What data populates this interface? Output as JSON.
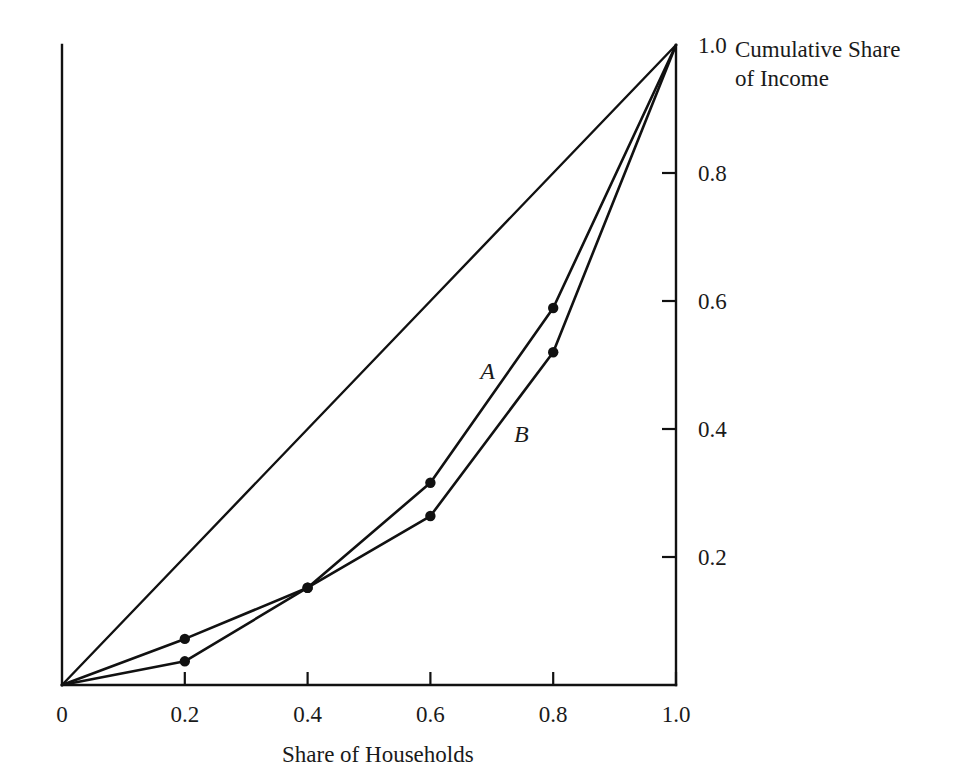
{
  "chart_data": {
    "type": "line",
    "title": "",
    "subtitle": "",
    "xlabel": "Share of Households",
    "ylabel": "Cumulative Share\nof Income",
    "xlim": [
      0,
      1.0
    ],
    "ylim": [
      0,
      1.0
    ],
    "grid": false,
    "legend_position": "inline-curve-labels",
    "x_ticks": [
      {
        "value": 0,
        "label": "0"
      },
      {
        "value": 0.2,
        "label": "0.2"
      },
      {
        "value": 0.4,
        "label": "0.4"
      },
      {
        "value": 0.6,
        "label": "0.6"
      },
      {
        "value": 0.8,
        "label": "0.8"
      },
      {
        "value": 1.0,
        "label": "1.0"
      }
    ],
    "y_ticks": [
      {
        "value": 0.2,
        "label": "0.2"
      },
      {
        "value": 0.4,
        "label": "0.4"
      },
      {
        "value": 0.6,
        "label": "0.6"
      },
      {
        "value": 0.8,
        "label": "0.8"
      },
      {
        "value": 1.0,
        "label": "1.0"
      }
    ],
    "y_axis_side": "right",
    "x": [
      0,
      0.2,
      0.4,
      0.6,
      0.8,
      1.0
    ],
    "series": [
      {
        "name": "line-of-equality",
        "label": "",
        "markers": false,
        "values": [
          0,
          0.2,
          0.4,
          0.6,
          0.8,
          1.0
        ]
      },
      {
        "name": "A",
        "label": "A",
        "markers": true,
        "values": [
          0,
          0.072,
          0.152,
          0.316,
          0.589,
          1.0
        ]
      },
      {
        "name": "B",
        "label": "B",
        "markers": true,
        "values": [
          0,
          0.037,
          0.152,
          0.264,
          0.52,
          1.0
        ]
      }
    ],
    "annotations": [
      {
        "name": "curve-label-a",
        "text": "A",
        "x": 0.693,
        "y": 0.49
      },
      {
        "name": "curve-label-b",
        "text": "B",
        "x": 0.748,
        "y": 0.392
      }
    ],
    "colors": {
      "line": "#111111",
      "axis": "#111111",
      "text": "#1a1a1a",
      "background": "#ffffff"
    }
  }
}
